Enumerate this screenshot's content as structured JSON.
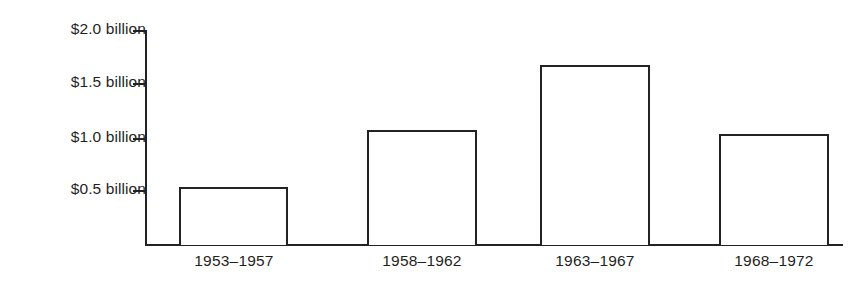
{
  "chart_data": {
    "type": "bar",
    "title": "",
    "subtitle": "",
    "xlabel": "",
    "ylabel": "",
    "categories": [
      "1953–1957",
      "1958–1962",
      "1963–1967",
      "1968–1972"
    ],
    "values": [
      0.54,
      1.07,
      1.67,
      1.03
    ],
    "value_unit": "billion dollars",
    "ylim": [
      0,
      2.0
    ],
    "yticks": [
      0.5,
      1.0,
      1.5,
      2.0
    ],
    "ytick_labels": [
      "$0.5 billion",
      "$1.0 billion",
      "$1.5 billion",
      "$2.0 billion"
    ],
    "grid": false,
    "legend": false,
    "bar_style": {
      "fill": "#ffffff",
      "outline": "#232323",
      "outline_width_px": 2
    },
    "axis_color": "#222222"
  },
  "axis": {
    "y_ticks": [
      {
        "label": "$2.0 billion",
        "value": 2.0
      },
      {
        "label": "$1.5 billion",
        "value": 1.5
      },
      {
        "label": "$1.0 billion",
        "value": 1.0
      },
      {
        "label": "$0.5 billion",
        "value": 0.5
      }
    ]
  },
  "bars": [
    {
      "label": "1953–1957",
      "value": 0.54
    },
    {
      "label": "1958–1962",
      "value": 1.07
    },
    {
      "label": "1963–1967",
      "value": 1.67
    },
    {
      "label": "1968–1972",
      "value": 1.03
    }
  ]
}
